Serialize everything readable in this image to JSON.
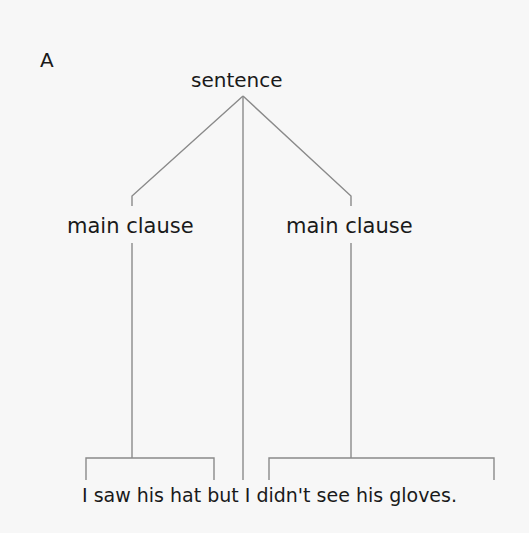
{
  "diagram": {
    "panel_label": "A",
    "root": {
      "label": "sentence"
    },
    "children": [
      {
        "label": "main clause",
        "span": "I saw his hat"
      },
      {
        "label": "main clause",
        "span": "I didn't see his gloves."
      }
    ],
    "conjunction": "but",
    "sentence": "I saw his hat but I didn't see his gloves.",
    "line_color": "#8a8a8a",
    "text_color": "#1a1a1a"
  }
}
